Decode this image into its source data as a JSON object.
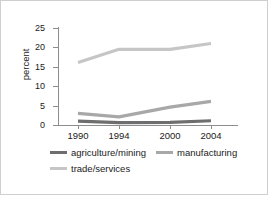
{
  "chart_data": {
    "type": "line",
    "title": "",
    "subtitle": "",
    "xlabel": "",
    "ylabel": "percent",
    "x": [
      1990,
      1994,
      2000,
      2004
    ],
    "xtick_labels": [
      "1990",
      "1994",
      "2000",
      "2004"
    ],
    "ytick_labels": [
      "0",
      "5",
      "10",
      "15",
      "20",
      "25"
    ],
    "ytick_values": [
      0,
      5,
      10,
      15,
      20,
      25
    ],
    "ylim": [
      0,
      25
    ],
    "xlim": [
      1988.5,
      2005.5
    ],
    "grid": false,
    "legend_position": "below",
    "series": [
      {
        "name": "agriculture/mining",
        "values": [
          1.0,
          0.6,
          0.7,
          1.1
        ],
        "color": "#6e6e6e"
      },
      {
        "name": "manufacturing",
        "values": [
          3.0,
          2.1,
          4.6,
          6.1
        ],
        "color": "#a8a8a8"
      },
      {
        "name": "trade/services",
        "values": [
          16.1,
          19.5,
          19.5,
          21.0
        ],
        "color": "#c6c6c6"
      }
    ]
  },
  "axis": {
    "ylabel": "percent",
    "yticks": [
      "25",
      "20",
      "15",
      "10",
      "5",
      "0"
    ],
    "xticks": [
      "1990",
      "1994",
      "2000",
      "2004"
    ]
  },
  "legend": {
    "items": [
      {
        "label": "agriculture/mining",
        "color": "#6e6e6e"
      },
      {
        "label": "manufacturing",
        "color": "#a8a8a8"
      },
      {
        "label": "trade/services",
        "color": "#c6c6c6"
      }
    ]
  },
  "colors": {
    "axis": "#8d8d8d",
    "text": "#1a1a1a",
    "border": "#cfcfcf",
    "background": "#ffffff"
  }
}
